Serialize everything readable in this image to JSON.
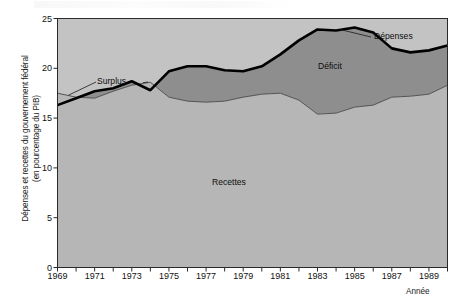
{
  "figure": {
    "axis_y_label_line1": "Dépenses et recettes du gouvernement fédéral",
    "axis_y_label_line2": "(en pourcentage du PIB)",
    "axis_x_label": "Année",
    "annotations": {
      "surplus": "Surplus",
      "deficit": "Déficit",
      "recettes": "Recettes",
      "depenses": "Dépenses"
    },
    "colors": {
      "revenue_fill": "#b6b6b6",
      "deficit_fill": "#8e8e8e",
      "surplus_fill": "#a0a0a0",
      "plot_background": "#c3c3c3",
      "spending_line": "#000000",
      "revenue_line": "#4a4a4a",
      "axis": "#2a2a2a"
    }
  },
  "chart_data": {
    "type": "area",
    "title": "",
    "subtitle": "",
    "xlabel": "Année",
    "ylabel": "Dépenses et recettes du gouvernement fédéral (en pourcentage du PIB)",
    "xlim": [
      1969,
      1990
    ],
    "ylim": [
      0,
      25
    ],
    "yticks": [
      0,
      5,
      10,
      15,
      20,
      25
    ],
    "xticks": [
      1969,
      1970,
      1971,
      1972,
      1973,
      1974,
      1975,
      1976,
      1977,
      1978,
      1979,
      1980,
      1981,
      1982,
      1983,
      1984,
      1985,
      1986,
      1987,
      1988,
      1989,
      1990
    ],
    "xtick_labels_shown": [
      1969,
      1971,
      1973,
      1975,
      1977,
      1979,
      1981,
      1983,
      1985,
      1987,
      1989
    ],
    "grid": false,
    "legend_position": "inline-annotations",
    "x": [
      1969,
      1970,
      1971,
      1972,
      1973,
      1974,
      1975,
      1976,
      1977,
      1978,
      1979,
      1980,
      1981,
      1982,
      1983,
      1984,
      1985,
      1986,
      1987,
      1988,
      1989,
      1990
    ],
    "series": [
      {
        "name": "Dépenses",
        "label": "Dépenses",
        "values": [
          16.3,
          17.0,
          17.7,
          18.0,
          18.7,
          17.8,
          19.7,
          20.2,
          20.2,
          19.8,
          19.7,
          20.2,
          21.4,
          22.8,
          23.9,
          23.8,
          24.1,
          23.6,
          22.0,
          21.6,
          21.8,
          22.3
        ]
      },
      {
        "name": "Recettes",
        "label": "Recettes",
        "values": [
          17.5,
          17.1,
          17.0,
          17.7,
          18.3,
          18.6,
          17.1,
          16.7,
          16.6,
          16.7,
          17.1,
          17.4,
          17.5,
          16.8,
          15.4,
          15.5,
          16.1,
          16.3,
          17.1,
          17.2,
          17.4,
          18.3
        ]
      }
    ],
    "derived": {
      "surplus_years": [
        1969,
        1972,
        1973,
        1974
      ],
      "deficit_years": [
        1970,
        1971,
        1975,
        1976,
        1977,
        1978,
        1979,
        1980,
        1981,
        1982,
        1983,
        1984,
        1985,
        1986,
        1987,
        1988,
        1989,
        1990
      ]
    }
  }
}
